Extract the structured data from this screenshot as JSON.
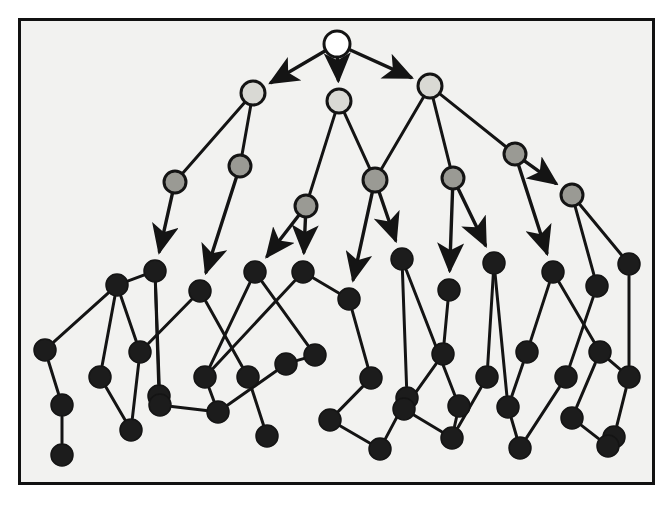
{
  "figure": {
    "canvas": {
      "width": 670,
      "height": 507
    },
    "frame": {
      "x": 18,
      "y": 18,
      "width": 637,
      "height": 467,
      "border_color": "#111111",
      "border_width": 3
    },
    "background_color": "#f2f2f0"
  },
  "legend_colors": {
    "root_fill": "#ffffff",
    "level2_fill": "#d9d9d4",
    "level3_fill": "#9a9a94",
    "leaf_fill": "#1c1c1c",
    "stroke": "#141414"
  },
  "graph_data": {
    "type": "node-link-diagram",
    "node_radius_default": 11,
    "nodes": [
      {
        "id": "n0",
        "x": 337,
        "y": 44,
        "r": 13,
        "shade": "root",
        "label": ""
      },
      {
        "id": "n1",
        "x": 253,
        "y": 93,
        "r": 12,
        "shade": "level2",
        "label": ""
      },
      {
        "id": "n2",
        "x": 339,
        "y": 101,
        "r": 12,
        "shade": "level2",
        "label": ""
      },
      {
        "id": "n3",
        "x": 430,
        "y": 86,
        "r": 12,
        "shade": "level2",
        "label": ""
      },
      {
        "id": "n4",
        "x": 175,
        "y": 182,
        "r": 11,
        "shade": "level3",
        "label": ""
      },
      {
        "id": "n5",
        "x": 240,
        "y": 166,
        "r": 11,
        "shade": "level3",
        "label": ""
      },
      {
        "id": "n6",
        "x": 306,
        "y": 206,
        "r": 11,
        "shade": "level3",
        "label": ""
      },
      {
        "id": "n7",
        "x": 375,
        "y": 180,
        "r": 12,
        "shade": "level3",
        "label": ""
      },
      {
        "id": "n8",
        "x": 453,
        "y": 178,
        "r": 11,
        "shade": "level3",
        "label": ""
      },
      {
        "id": "n9",
        "x": 515,
        "y": 154,
        "r": 11,
        "shade": "level3",
        "label": ""
      },
      {
        "id": "n10",
        "x": 572,
        "y": 195,
        "r": 11,
        "shade": "level3",
        "label": ""
      },
      {
        "id": "n11",
        "x": 155,
        "y": 271,
        "r": 11,
        "shade": "leaf",
        "label": ""
      },
      {
        "id": "n12",
        "x": 117,
        "y": 285,
        "r": 11,
        "shade": "leaf",
        "label": ""
      },
      {
        "id": "n13",
        "x": 200,
        "y": 291,
        "r": 11,
        "shade": "leaf",
        "label": ""
      },
      {
        "id": "n14",
        "x": 255,
        "y": 272,
        "r": 11,
        "shade": "leaf",
        "label": ""
      },
      {
        "id": "n15",
        "x": 303,
        "y": 272,
        "r": 11,
        "shade": "leaf",
        "label": ""
      },
      {
        "id": "n16",
        "x": 349,
        "y": 299,
        "r": 11,
        "shade": "leaf",
        "label": ""
      },
      {
        "id": "n17",
        "x": 402,
        "y": 259,
        "r": 11,
        "shade": "leaf",
        "label": ""
      },
      {
        "id": "n18",
        "x": 449,
        "y": 290,
        "r": 11,
        "shade": "leaf",
        "label": ""
      },
      {
        "id": "n19",
        "x": 494,
        "y": 263,
        "r": 11,
        "shade": "leaf",
        "label": ""
      },
      {
        "id": "n20",
        "x": 553,
        "y": 272,
        "r": 11,
        "shade": "leaf",
        "label": ""
      },
      {
        "id": "n21",
        "x": 597,
        "y": 286,
        "r": 11,
        "shade": "leaf",
        "label": ""
      },
      {
        "id": "n22",
        "x": 629,
        "y": 264,
        "r": 11,
        "shade": "leaf",
        "label": ""
      },
      {
        "id": "n23",
        "x": 45,
        "y": 350,
        "r": 11,
        "shade": "leaf",
        "label": ""
      },
      {
        "id": "n24",
        "x": 100,
        "y": 377,
        "r": 11,
        "shade": "leaf",
        "label": ""
      },
      {
        "id": "n25",
        "x": 140,
        "y": 352,
        "r": 11,
        "shade": "leaf",
        "label": ""
      },
      {
        "id": "n26",
        "x": 159,
        "y": 396,
        "r": 11,
        "shade": "leaf",
        "label": ""
      },
      {
        "id": "n27",
        "x": 205,
        "y": 377,
        "r": 11,
        "shade": "leaf",
        "label": ""
      },
      {
        "id": "n28",
        "x": 248,
        "y": 377,
        "r": 11,
        "shade": "leaf",
        "label": ""
      },
      {
        "id": "n29",
        "x": 286,
        "y": 364,
        "r": 11,
        "shade": "leaf",
        "label": ""
      },
      {
        "id": "n30",
        "x": 315,
        "y": 355,
        "r": 11,
        "shade": "leaf",
        "label": ""
      },
      {
        "id": "n31",
        "x": 371,
        "y": 378,
        "r": 11,
        "shade": "leaf",
        "label": ""
      },
      {
        "id": "n32",
        "x": 407,
        "y": 398,
        "r": 11,
        "shade": "leaf",
        "label": ""
      },
      {
        "id": "n33",
        "x": 443,
        "y": 354,
        "r": 11,
        "shade": "leaf",
        "label": ""
      },
      {
        "id": "n34",
        "x": 487,
        "y": 377,
        "r": 11,
        "shade": "leaf",
        "label": ""
      },
      {
        "id": "n35",
        "x": 527,
        "y": 352,
        "r": 11,
        "shade": "leaf",
        "label": ""
      },
      {
        "id": "n36",
        "x": 566,
        "y": 377,
        "r": 11,
        "shade": "leaf",
        "label": ""
      },
      {
        "id": "n37",
        "x": 600,
        "y": 352,
        "r": 11,
        "shade": "leaf",
        "label": ""
      },
      {
        "id": "n38",
        "x": 629,
        "y": 377,
        "r": 11,
        "shade": "leaf",
        "label": ""
      },
      {
        "id": "n39",
        "x": 62,
        "y": 405,
        "r": 11,
        "shade": "leaf",
        "label": ""
      },
      {
        "id": "n40",
        "x": 131,
        "y": 430,
        "r": 11,
        "shade": "leaf",
        "label": ""
      },
      {
        "id": "n41",
        "x": 160,
        "y": 405,
        "r": 11,
        "shade": "leaf",
        "label": ""
      },
      {
        "id": "n42",
        "x": 218,
        "y": 412,
        "r": 11,
        "shade": "leaf",
        "label": ""
      },
      {
        "id": "n43",
        "x": 267,
        "y": 436,
        "r": 11,
        "shade": "leaf",
        "label": ""
      },
      {
        "id": "n44",
        "x": 330,
        "y": 420,
        "r": 11,
        "shade": "leaf",
        "label": ""
      },
      {
        "id": "n45",
        "x": 380,
        "y": 449,
        "r": 11,
        "shade": "leaf",
        "label": ""
      },
      {
        "id": "n46",
        "x": 404,
        "y": 409,
        "r": 11,
        "shade": "leaf",
        "label": ""
      },
      {
        "id": "n47",
        "x": 452,
        "y": 438,
        "r": 11,
        "shade": "leaf",
        "label": ""
      },
      {
        "id": "n48",
        "x": 459,
        "y": 406,
        "r": 11,
        "shade": "leaf",
        "label": ""
      },
      {
        "id": "n49",
        "x": 508,
        "y": 407,
        "r": 11,
        "shade": "leaf",
        "label": ""
      },
      {
        "id": "n50",
        "x": 520,
        "y": 448,
        "r": 11,
        "shade": "leaf",
        "label": ""
      },
      {
        "id": "n51",
        "x": 572,
        "y": 418,
        "r": 11,
        "shade": "leaf",
        "label": ""
      },
      {
        "id": "n52",
        "x": 614,
        "y": 437,
        "r": 11,
        "shade": "leaf",
        "label": ""
      },
      {
        "id": "n53",
        "x": 62,
        "y": 455,
        "r": 11,
        "shade": "leaf",
        "label": ""
      },
      {
        "id": "n54",
        "x": 608,
        "y": 446,
        "r": 11,
        "shade": "leaf",
        "label": ""
      }
    ],
    "edges": [
      {
        "from": "n0",
        "to": "n1",
        "arrow": true
      },
      {
        "from": "n0",
        "to": "n2",
        "arrow": true
      },
      {
        "from": "n0",
        "to": "n3",
        "arrow": true
      },
      {
        "from": "n1",
        "to": "n4",
        "arrow": false
      },
      {
        "from": "n1",
        "to": "n5",
        "arrow": false
      },
      {
        "from": "n2",
        "to": "n6",
        "arrow": false
      },
      {
        "from": "n2",
        "to": "n7",
        "arrow": false
      },
      {
        "from": "n3",
        "to": "n7",
        "arrow": false
      },
      {
        "from": "n3",
        "to": "n8",
        "arrow": false
      },
      {
        "from": "n3",
        "to": "n9",
        "arrow": false
      },
      {
        "from": "n9",
        "to": "n10",
        "arrow": true
      },
      {
        "from": "n4",
        "to": "n11",
        "arrow": true
      },
      {
        "from": "n5",
        "to": "n13",
        "arrow": true
      },
      {
        "from": "n6",
        "to": "n14",
        "arrow": true
      },
      {
        "from": "n6",
        "to": "n15",
        "arrow": true
      },
      {
        "from": "n7",
        "to": "n16",
        "arrow": true
      },
      {
        "from": "n7",
        "to": "n17",
        "arrow": true
      },
      {
        "from": "n8",
        "to": "n18",
        "arrow": true
      },
      {
        "from": "n8",
        "to": "n19",
        "arrow": true
      },
      {
        "from": "n9",
        "to": "n20",
        "arrow": true
      },
      {
        "from": "n10",
        "to": "n21",
        "arrow": false
      },
      {
        "from": "n10",
        "to": "n22",
        "arrow": false
      },
      {
        "from": "n11",
        "to": "n12",
        "arrow": false
      },
      {
        "from": "n11",
        "to": "n26",
        "arrow": false
      },
      {
        "from": "n12",
        "to": "n23",
        "arrow": false
      },
      {
        "from": "n12",
        "to": "n24",
        "arrow": false
      },
      {
        "from": "n12",
        "to": "n25",
        "arrow": false
      },
      {
        "from": "n13",
        "to": "n28",
        "arrow": false
      },
      {
        "from": "n14",
        "to": "n27",
        "arrow": false
      },
      {
        "from": "n14",
        "to": "n30",
        "arrow": false
      },
      {
        "from": "n15",
        "to": "n27",
        "arrow": false
      },
      {
        "from": "n15",
        "to": "n16",
        "arrow": false
      },
      {
        "from": "n16",
        "to": "n31",
        "arrow": false
      },
      {
        "from": "n17",
        "to": "n32",
        "arrow": false
      },
      {
        "from": "n18",
        "to": "n33",
        "arrow": false
      },
      {
        "from": "n19",
        "to": "n34",
        "arrow": false
      },
      {
        "from": "n20",
        "to": "n35",
        "arrow": false
      },
      {
        "from": "n20",
        "to": "n37",
        "arrow": false
      },
      {
        "from": "n21",
        "to": "n36",
        "arrow": false
      },
      {
        "from": "n22",
        "to": "n38",
        "arrow": false
      },
      {
        "from": "n23",
        "to": "n39",
        "arrow": false
      },
      {
        "from": "n24",
        "to": "n40",
        "arrow": false
      },
      {
        "from": "n25",
        "to": "n40",
        "arrow": false
      },
      {
        "from": "n26",
        "to": "n41",
        "arrow": false
      },
      {
        "from": "n27",
        "to": "n42",
        "arrow": false
      },
      {
        "from": "n28",
        "to": "n43",
        "arrow": false
      },
      {
        "from": "n29",
        "to": "n42",
        "arrow": false
      },
      {
        "from": "n30",
        "to": "n29",
        "arrow": false
      },
      {
        "from": "n31",
        "to": "n44",
        "arrow": false
      },
      {
        "from": "n32",
        "to": "n45",
        "arrow": false
      },
      {
        "from": "n33",
        "to": "n46",
        "arrow": false
      },
      {
        "from": "n34",
        "to": "n47",
        "arrow": false
      },
      {
        "from": "n35",
        "to": "n49",
        "arrow": false
      },
      {
        "from": "n36",
        "to": "n50",
        "arrow": false
      },
      {
        "from": "n37",
        "to": "n51",
        "arrow": false
      },
      {
        "from": "n38",
        "to": "n52",
        "arrow": false
      },
      {
        "from": "n39",
        "to": "n53",
        "arrow": false
      },
      {
        "from": "n41",
        "to": "n42",
        "arrow": false
      },
      {
        "from": "n44",
        "to": "n45",
        "arrow": false
      },
      {
        "from": "n46",
        "to": "n47",
        "arrow": false
      },
      {
        "from": "n48",
        "to": "n47",
        "arrow": false
      },
      {
        "from": "n49",
        "to": "n50",
        "arrow": false
      },
      {
        "from": "n51",
        "to": "n54",
        "arrow": false
      },
      {
        "from": "n52",
        "to": "n54",
        "arrow": false
      },
      {
        "from": "n13",
        "to": "n25",
        "arrow": false
      },
      {
        "from": "n11",
        "to": "n41",
        "arrow": false
      },
      {
        "from": "n17",
        "to": "n48",
        "arrow": false
      },
      {
        "from": "n19",
        "to": "n49",
        "arrow": false
      },
      {
        "from": "n37",
        "to": "n38",
        "arrow": false
      }
    ]
  }
}
